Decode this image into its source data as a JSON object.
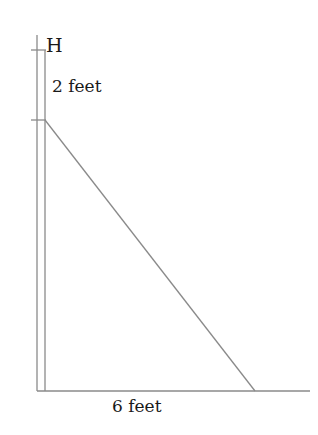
{
  "diagram": {
    "type": "right-triangle ladder/wall problem",
    "labels": {
      "top_point": "H",
      "vertical_segment": "2 feet",
      "base": "6 feet"
    },
    "colors": {
      "line": "#8a8a8a",
      "text": "#1a1a1a",
      "background": "#ffffff"
    }
  }
}
